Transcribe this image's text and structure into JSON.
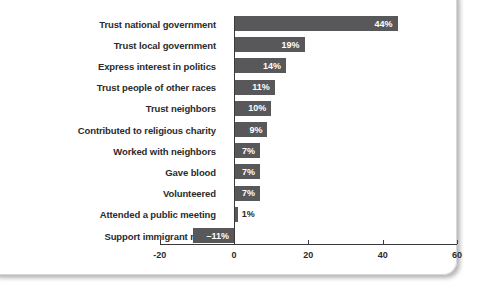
{
  "chart_data": {
    "type": "bar",
    "orientation": "horizontal",
    "title": "",
    "subtitle": "",
    "xlabel": "",
    "ylabel": "",
    "xlim": [
      -20,
      60
    ],
    "xticks": [
      -20,
      0,
      20,
      40,
      60
    ],
    "xtick_labels": [
      "-20",
      "0",
      "20",
      "40",
      "60"
    ],
    "grid": false,
    "legend": null,
    "value_suffix": "%",
    "bar_color": "#58585a",
    "inside_label_color": "#ffffff",
    "outside_label_color": "#2b2b2b",
    "categories": [
      "Trust national government",
      "Trust local government",
      "Express interest in politics",
      "Trust people of other races",
      "Trust neighbors",
      "Contributed to religious charity",
      "Worked with neighbors",
      "Gave blood",
      "Volunteered",
      "Attended a public meeting",
      "Support immigrant rights"
    ],
    "values": [
      44,
      19,
      14,
      11,
      10,
      9,
      7,
      7,
      7,
      1,
      -11
    ],
    "value_labels": [
      "44%",
      "19%",
      "14%",
      "11%",
      "10%",
      "9%",
      "7%",
      "7%",
      "7%",
      "1%",
      "–11%"
    ],
    "label_placement": [
      "inside",
      "inside",
      "inside",
      "inside",
      "inside",
      "inside",
      "inside",
      "inside",
      "inside",
      "outside",
      "inside"
    ]
  }
}
